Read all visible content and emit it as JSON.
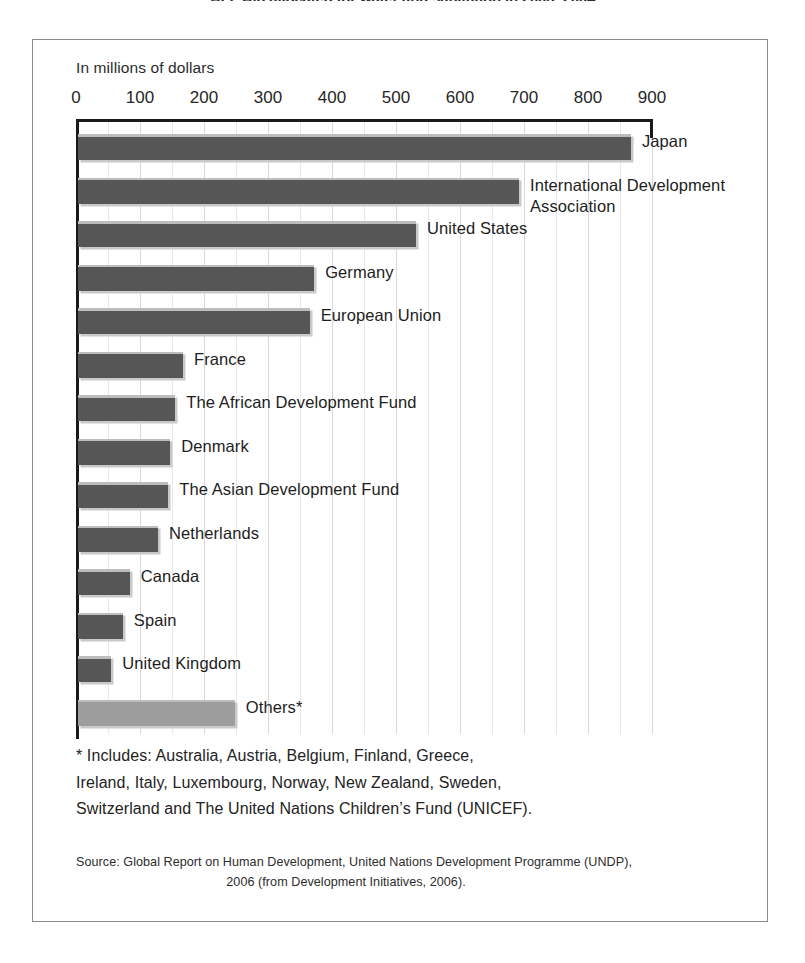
{
  "figure": {
    "title": "AFF Aid allocated for water and sanitation in 2003–2004",
    "axis_unit_caption": "In millions of dollars"
  },
  "chart_data": {
    "type": "bar",
    "orientation": "horizontal",
    "title": "AFF Aid allocated for water and sanitation in 2003–2004",
    "xlabel": "In millions of dollars",
    "ylabel": "",
    "xlim": [
      0,
      900
    ],
    "xticks": [
      0,
      100,
      200,
      300,
      400,
      500,
      600,
      700,
      800,
      900
    ],
    "xtick_labels": [
      "0",
      "100",
      "200",
      "300",
      "400",
      "500",
      "600",
      "700",
      "800",
      "900"
    ],
    "grid": true,
    "legend": "none",
    "categories": [
      "Japan",
      "International Development Association",
      "United States",
      "Germany",
      "European Union",
      "France",
      "The African Development Fund",
      "Denmark",
      "The Asian Development Fund",
      "Netherlands",
      "Canada",
      "Spain",
      "United Kingdom",
      "Others*"
    ],
    "values": [
      864,
      689,
      528,
      369,
      362,
      164,
      152,
      144,
      141,
      125,
      81,
      70,
      52,
      245
    ]
  },
  "bars": [
    {
      "label": "Japan",
      "value": 864,
      "style": "dark"
    },
    {
      "label": "International Development\nAssociation",
      "value": 689,
      "style": "dark"
    },
    {
      "label": "United States",
      "value": 528,
      "style": "dark"
    },
    {
      "label": "Germany",
      "value": 369,
      "style": "dark"
    },
    {
      "label": "European Union",
      "value": 362,
      "style": "dark"
    },
    {
      "label": "France",
      "value": 164,
      "style": "dark"
    },
    {
      "label": "The African Development Fund",
      "value": 152,
      "style": "dark"
    },
    {
      "label": "Denmark",
      "value": 144,
      "style": "dark"
    },
    {
      "label": "The Asian Development Fund",
      "value": 141,
      "style": "dark"
    },
    {
      "label": "Netherlands",
      "value": 125,
      "style": "dark"
    },
    {
      "label": "Canada",
      "value": 81,
      "style": "dark"
    },
    {
      "label": "Spain",
      "value": 70,
      "style": "dark"
    },
    {
      "label": "United Kingdom",
      "value": 52,
      "style": "dark"
    },
    {
      "label": "Others*",
      "value": 245,
      "style": "light"
    }
  ],
  "footnote": {
    "line1": "* Includes: Australia, Austria, Belgium, Finland, Greece,",
    "line2": "Ireland, Italy, Luxembourg, Norway, New Zealand, Sweden,",
    "line3": "Switzerland and The United Nations Children’s Fund (UNICEF)."
  },
  "source": {
    "line1": "Source: Global Report on Human Development, United Nations Development Programme (UNDP),",
    "line2": "2006 (from Development Initiatives, 2006)."
  },
  "colors": {
    "bar_dark": "#565656",
    "bar_light": "#9d9d9d",
    "bar_highlight": "#bdbdbd",
    "bar_shadow": "#c9c9c9",
    "frame_border": "#8a8a8a",
    "axis_rule": "#1a1a1a",
    "gridline": "#d8d8d8",
    "text": "#1d1d1d",
    "background": "#ffffff"
  }
}
